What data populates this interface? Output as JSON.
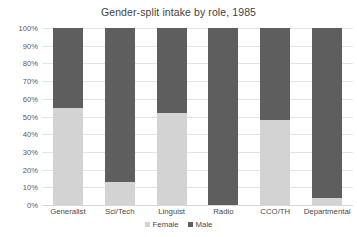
{
  "chart_data": {
    "type": "bar",
    "subtype": "100% stacked bar",
    "title": "Gender-split intake by role, 1985",
    "xlabel": "",
    "ylabel": "",
    "ylim": [
      0,
      100
    ],
    "yticks": [
      "0%",
      "10%",
      "20%",
      "30%",
      "40%",
      "50%",
      "60%",
      "70%",
      "80%",
      "90%",
      "100%"
    ],
    "ytick_values": [
      0,
      10,
      20,
      30,
      40,
      50,
      60,
      70,
      80,
      90,
      100
    ],
    "grid": true,
    "legend_position": "bottom-center",
    "categories": [
      "Generalist",
      "Sci/Tech",
      "Linguist",
      "Radio",
      "CCO/TH",
      "Departmental"
    ],
    "series": [
      {
        "name": "Female",
        "color": "#d3d3d3",
        "values": [
          55,
          13,
          52,
          0,
          48,
          4
        ]
      },
      {
        "name": "Male",
        "color": "#5e5e5e",
        "values": [
          45,
          87,
          48,
          100,
          52,
          96
        ]
      }
    ]
  },
  "colors": {
    "female": "#d3d3d3",
    "male": "#5e5e5e",
    "gridline": "#e4e4e4",
    "text": "#4a4a4a",
    "background": "#ffffff"
  }
}
